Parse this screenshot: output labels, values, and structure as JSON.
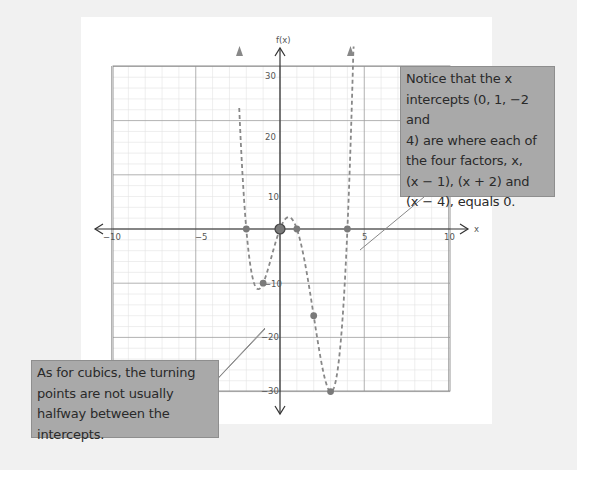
{
  "chart_data": {
    "type": "line",
    "title": "",
    "function": "f(x) = x(x - 1)(x + 2)(x - 4)",
    "xlabel": "x",
    "ylabel": "f(x)",
    "xlim": [
      -10,
      10
    ],
    "ylim": [
      -30,
      30
    ],
    "x_ticks": [
      -10,
      -5,
      5,
      10
    ],
    "x_tick_labels": [
      "−10",
      "−5",
      "5",
      "10"
    ],
    "y_ticks": [
      30,
      20,
      10,
      -10,
      -20,
      -30
    ],
    "y_tick_labels": [
      "30",
      "20",
      "10",
      "−10",
      "−20",
      "−30"
    ],
    "grid": true,
    "line_style": "dashed",
    "points": [
      {
        "x": -2,
        "y": 0,
        "label": "x-intercept"
      },
      {
        "x": -1,
        "y": -10
      },
      {
        "x": 0,
        "y": 0,
        "label": "x-intercept / y-intercept"
      },
      {
        "x": 1,
        "y": 0,
        "label": "x-intercept"
      },
      {
        "x": 2,
        "y": -16
      },
      {
        "x": 3,
        "y": -30
      },
      {
        "x": 4,
        "y": 0,
        "label": "x-intercept"
      }
    ],
    "x_intercepts": [
      -2,
      0,
      1,
      4
    ],
    "annotations": [
      "Notice that the x intercepts (0, 1, −2 and 4) are where each of the four factors, x, (x − 1), (x + 2) and (x − 4), equals 0.",
      "As for cubics, the turning points are not usually halfway between the intercepts."
    ]
  },
  "axes": {
    "x_label": "x",
    "y_label": "f(x)",
    "x_tick_labels": [
      "−10",
      "−5",
      "5",
      "10"
    ],
    "y_tick_labels": [
      "30",
      "20",
      "10",
      "−10",
      "−20",
      "−30"
    ]
  },
  "callouts": {
    "right": {
      "lines": [
        "Notice that the x",
        "intercepts (0, 1, −2  and",
        "4) are where each of",
        "the four factors, x,",
        "(x − 1), (x + 2) and",
        "(x − 4), equals 0."
      ]
    },
    "left": {
      "lines": [
        "As for cubics, the turning",
        "points are not usually",
        "halfway between the",
        "intercepts."
      ]
    }
  },
  "colors": {
    "curve": "#888888",
    "points": "#7a7a7a",
    "callout_bg": "#a9a9a9",
    "grid_major": "#9a9a9a",
    "grid_minor": "#dddddd",
    "axis": "#333333"
  }
}
